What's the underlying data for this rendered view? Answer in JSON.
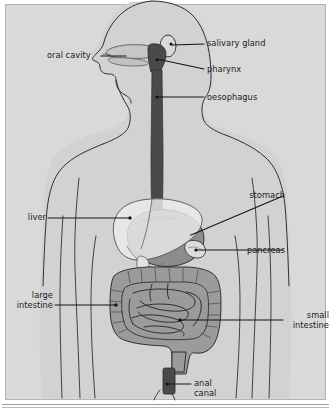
{
  "figure": {
    "background_color": "#d9d9d9",
    "frame_border_color": "#b4b4b4",
    "outline_color": "#2b2b2b",
    "leader_line_color": "#141414"
  },
  "palette": {
    "body_fill": "#d2d2d2",
    "body_outline": "#303030",
    "oral_cavity_fill": "#c6c6c6",
    "salivary_gland_fill": "#d8d8d8",
    "pharynx_fill": "#4a4a4a",
    "oesophagus_fill": "#4a4a4a",
    "liver_fill": "#ececeb",
    "stomach_fill": "#8c8c8c",
    "pancreas_fill": "#dcdcdc",
    "intestine_fill": "#9b9b9b",
    "anal_canal_fill": "#4a4a4a"
  },
  "labels": [
    {
      "id": "oral-cavity",
      "text": "oral cavity",
      "side": "left",
      "text_x": 47,
      "text_y": 51,
      "leader_from": [
        101,
        56
      ],
      "leader_to": [
        126,
        56
      ]
    },
    {
      "id": "salivary-gland",
      "text": "salivary gland",
      "side": "right",
      "text_x": 207,
      "text_y": 39,
      "leader_from": [
        204,
        44
      ],
      "leader_to": [
        172,
        45
      ]
    },
    {
      "id": "pharynx",
      "text": "pharynx",
      "side": "right",
      "text_x": 207,
      "text_y": 65,
      "leader_from": [
        204,
        69
      ],
      "leader_to": [
        157,
        59
      ]
    },
    {
      "id": "oesophagus",
      "text": "oesophagus",
      "side": "right",
      "text_x": 207,
      "text_y": 93,
      "leader_from": [
        204,
        97
      ],
      "leader_to": [
        157,
        97
      ]
    },
    {
      "id": "stomach",
      "text": "stomach",
      "side": "right",
      "text_x": 285,
      "text_y": 191,
      "leader_from": [
        283,
        196
      ],
      "leader_to": [
        191,
        235
      ]
    },
    {
      "id": "pancreas",
      "text": "pancreas",
      "side": "right",
      "text_x": 285,
      "text_y": 246,
      "leader_from": [
        283,
        250
      ],
      "leader_to": [
        196,
        250
      ]
    },
    {
      "id": "liver",
      "text": "liver",
      "side": "left",
      "text_x": 22,
      "text_y": 213,
      "leader_from": [
        48,
        218
      ],
      "leader_to": [
        130,
        218
      ]
    },
    {
      "id": "large-intestine",
      "text": "large\nintestine",
      "side": "left",
      "text_x": 20,
      "text_y": 291,
      "leader_from": [
        55,
        305
      ],
      "leader_to": [
        116,
        305
      ]
    },
    {
      "id": "small-intestine",
      "text": "small\nintestine",
      "side": "right",
      "text_x": 285,
      "text_y": 311,
      "leader_from": [
        283,
        320
      ],
      "leader_to": [
        180,
        320
      ]
    },
    {
      "id": "anal-canal",
      "text": "anal\ncanal",
      "side": "right",
      "text_x": 194,
      "text_y": 379,
      "leader_from": [
        191,
        384
      ],
      "leader_to": [
        167,
        384
      ]
    }
  ],
  "organs": [
    {
      "id": "oral-cavity",
      "name": "oral cavity"
    },
    {
      "id": "salivary-gland",
      "name": "salivary gland"
    },
    {
      "id": "pharynx",
      "name": "pharynx"
    },
    {
      "id": "oesophagus",
      "name": "oesophagus"
    },
    {
      "id": "liver",
      "name": "liver"
    },
    {
      "id": "stomach",
      "name": "stomach"
    },
    {
      "id": "pancreas",
      "name": "pancreas"
    },
    {
      "id": "large-intestine",
      "name": "large intestine"
    },
    {
      "id": "small-intestine",
      "name": "small intestine"
    },
    {
      "id": "anal-canal",
      "name": "anal canal"
    }
  ]
}
